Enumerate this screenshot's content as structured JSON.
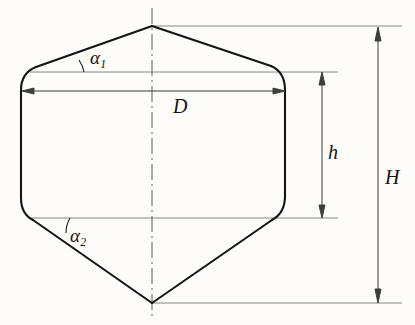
{
  "figure": {
    "type": "engineering-dimension-diagram",
    "background_color": "#fdfcf8",
    "line_color": "#141414",
    "dimension_line_color": "#5a5a5a",
    "labels": {
      "alpha1": "α",
      "alpha1_sub": "1",
      "alpha2": "α",
      "alpha2_sub": "2",
      "diameter": "D",
      "cylindrical_height": "h",
      "overall_height": "H"
    },
    "geometry": {
      "top_vertex": [
        152,
        26
      ],
      "bottom_vertex": [
        152,
        303
      ],
      "body_left_x": 21,
      "body_right_x": 285,
      "body_top_y": 72,
      "body_bottom_y": 218,
      "corner_radius": 22,
      "centerline_x": 152
    },
    "dimensions": [
      {
        "name": "D",
        "orientation": "horizontal",
        "y": 91,
        "x_start": 22,
        "x_end": 285,
        "arrows": "both"
      },
      {
        "name": "h",
        "orientation": "vertical",
        "x": 322,
        "y_start": 72,
        "y_end": 218,
        "arrows": "both"
      },
      {
        "name": "H",
        "orientation": "vertical",
        "x": 378,
        "y_start": 27,
        "y_end": 303,
        "arrows": "both"
      }
    ],
    "angles": [
      {
        "name": "alpha1",
        "vertex": [
          58,
          72
        ],
        "at": "upper-left cone slope"
      },
      {
        "name": "alpha2",
        "vertex": [
          47,
          218
        ],
        "at": "lower-left cone slope"
      }
    ]
  }
}
